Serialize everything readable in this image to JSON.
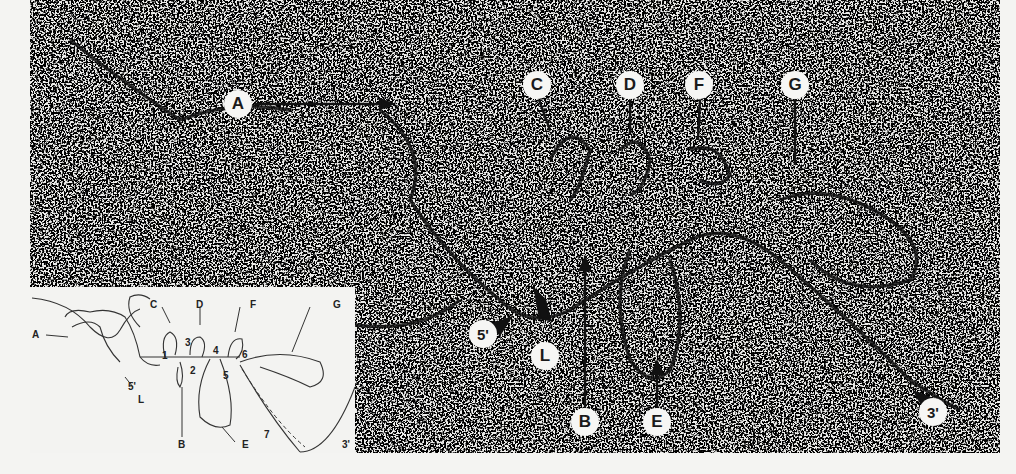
{
  "figure": {
    "type": "electron micrograph",
    "micrograph_labels": [
      {
        "id": "A",
        "x": 238,
        "y": 104
      },
      {
        "id": "C",
        "x": 537,
        "y": 85
      },
      {
        "id": "D",
        "x": 630,
        "y": 85
      },
      {
        "id": "F",
        "x": 699,
        "y": 85
      },
      {
        "id": "G",
        "x": 795,
        "y": 85
      },
      {
        "id": "5'",
        "x": 483,
        "y": 334
      },
      {
        "id": "L",
        "x": 545,
        "y": 356
      },
      {
        "id": "B",
        "x": 585,
        "y": 422
      },
      {
        "id": "E",
        "x": 657,
        "y": 422
      },
      {
        "id": "3'",
        "x": 933,
        "y": 412
      }
    ],
    "inset": {
      "letter_labels": [
        "A",
        "B",
        "C",
        "D",
        "E",
        "F",
        "G",
        "L"
      ],
      "end_labels": [
        "5'",
        "3'"
      ],
      "number_labels": [
        "1",
        "2",
        "3",
        "4",
        "5",
        "6",
        "7"
      ]
    }
  }
}
